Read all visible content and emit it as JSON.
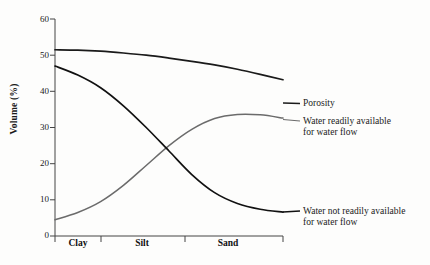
{
  "chart_data": {
    "type": "line",
    "title": "",
    "xlabel": "",
    "ylabel": "Volume (%)",
    "ylim": [
      0,
      60
    ],
    "yticks": [
      0,
      10,
      20,
      30,
      40,
      50,
      60
    ],
    "ytick_labels": [
      "0",
      "10",
      "20",
      "30",
      "40",
      "50",
      "60"
    ],
    "xlim": [
      0,
      100
    ],
    "grid": false,
    "legend_position": "right-of-axes (inline end-of-line labels)",
    "categories": [
      "Clay",
      "Silt",
      "Sand"
    ],
    "category_boundaries": [
      0,
      20,
      57,
      100
    ],
    "series": [
      {
        "name": "Porosity",
        "label": "Porosity",
        "color": "#1a1a1a",
        "width": 1.7,
        "x": [
          0,
          10,
          20,
          30,
          40,
          50,
          60,
          70,
          80,
          90,
          100
        ],
        "values": [
          51.5,
          51.4,
          51.1,
          50.6,
          50.0,
          49.2,
          48.3,
          47.3,
          46.1,
          44.7,
          43.2
        ]
      },
      {
        "name": "Water readily available for water flow",
        "label": "Water readily available",
        "label_line2": "for water flow",
        "color": "#6b6b6b",
        "width": 1.5,
        "x": [
          0,
          10,
          20,
          30,
          40,
          50,
          60,
          70,
          80,
          90,
          100
        ],
        "values": [
          4.5,
          6.5,
          9.5,
          14.0,
          19.5,
          25.0,
          29.5,
          32.5,
          33.6,
          33.5,
          32.6
        ]
      },
      {
        "name": "Water not readily available for water flow",
        "label": "Water not readily available",
        "label_line2": "for water flow",
        "color": "#111111",
        "width": 1.7,
        "x": [
          0,
          10,
          20,
          30,
          40,
          50,
          60,
          70,
          80,
          90,
          100
        ],
        "values": [
          47.0,
          44.5,
          41.0,
          36.0,
          30.0,
          23.5,
          17.0,
          12.0,
          9.0,
          7.4,
          6.6
        ]
      }
    ],
    "annotations": [
      {
        "text": "Porosity",
        "at_x": 100,
        "at_y": 43.2
      },
      {
        "text": "Water readily available for water flow",
        "at_x": 100,
        "at_y": 32.6
      },
      {
        "text": "Water not readily available for water flow",
        "at_x": 100,
        "at_y": 6.6
      }
    ]
  },
  "axis": {
    "y_label": "Volume (%)",
    "y_ticks": [
      "60",
      "50",
      "40",
      "30",
      "20",
      "10",
      "0"
    ],
    "x_categories": [
      "Clay",
      "Silt",
      "Sand"
    ]
  },
  "labels": {
    "porosity": "Porosity",
    "readily_l1": "Water readily available",
    "readily_l2": "for water flow",
    "not_readily_l1": "Water not readily available",
    "not_readily_l2": "for water flow"
  }
}
